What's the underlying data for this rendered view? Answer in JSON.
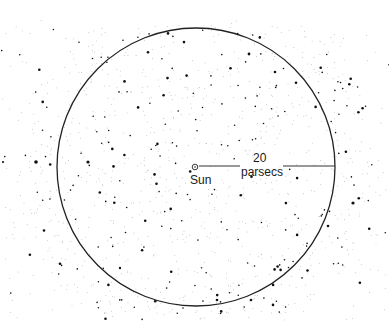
{
  "diagram": {
    "sun_label": "Sun",
    "radius_value": "20",
    "radius_unit": "parsecs",
    "circle": {
      "cx": 196,
      "cy": 167,
      "r": 139,
      "stroke": "#222222"
    },
    "sun": {
      "x": 195,
      "y": 167
    },
    "colors": {
      "background": "#ffffff",
      "stars": "#111111",
      "line": "#333333"
    }
  }
}
